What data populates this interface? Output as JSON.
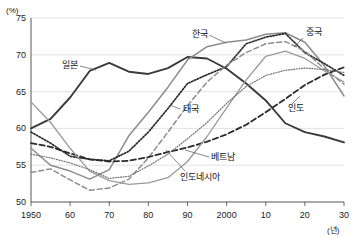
{
  "chart_data": {
    "type": "line",
    "title": "",
    "xlabel": "(년)",
    "ylabel": "(%)",
    "xlim": [
      1950,
      2030
    ],
    "ylim": [
      50,
      75
    ],
    "grid": true,
    "legend": "inline-annotations",
    "y_ticks": [
      "50",
      "55",
      "60",
      "65",
      "70",
      "75"
    ],
    "y_tick_values": [
      50,
      55,
      60,
      65,
      70,
      75
    ],
    "x_ticks": [
      "1950",
      "60",
      "70",
      "80",
      "90",
      "2000",
      "10",
      "20",
      "30"
    ],
    "x_tick_values": [
      1950,
      1960,
      1970,
      1980,
      1990,
      2000,
      2010,
      2020,
      2030
    ],
    "x": [
      1950,
      1955,
      1960,
      1965,
      1970,
      1975,
      1980,
      1985,
      1990,
      1995,
      2000,
      2005,
      2010,
      2015,
      2020,
      2025,
      2030
    ],
    "series": [
      {
        "name": "일본",
        "style": "solid-dark-thick",
        "color": "#3a3a3a",
        "values": [
          60.0,
          61.3,
          64.2,
          67.8,
          68.9,
          67.7,
          67.4,
          68.2,
          69.7,
          69.5,
          68.1,
          66.1,
          63.8,
          60.7,
          59.5,
          58.9,
          58.1
        ]
      },
      {
        "name": "한국",
        "style": "solid-gray",
        "color": "#8c8c8c",
        "values": [
          57.3,
          55.0,
          54.2,
          53.1,
          54.4,
          59.0,
          62.2,
          65.6,
          69.3,
          71.1,
          71.7,
          72.0,
          72.8,
          73.0,
          71.7,
          68.5,
          64.4
        ]
      },
      {
        "name": "중국",
        "style": "dotted-dark",
        "color": "#2b2b2b",
        "values": [
          59.5,
          58.0,
          56.2,
          55.8,
          55.6,
          56.9,
          59.5,
          62.7,
          66.1,
          67.3,
          68.4,
          71.5,
          72.4,
          72.9,
          70.3,
          68.8,
          67.2
        ]
      },
      {
        "name": "태국",
        "style": "dashed-gray",
        "color": "#8c8c8c",
        "values": [
          54.0,
          54.5,
          53.0,
          51.6,
          51.9,
          53.1,
          56.0,
          59.5,
          63.1,
          66.3,
          68.6,
          70.3,
          71.5,
          71.8,
          70.5,
          68.1,
          66.0
        ]
      },
      {
        "name": "인도",
        "style": "dashed-dark",
        "color": "#2b2b2b",
        "values": [
          58.0,
          57.5,
          56.6,
          55.8,
          55.5,
          55.6,
          56.1,
          56.8,
          57.4,
          58.2,
          59.2,
          60.5,
          62.2,
          64.0,
          65.9,
          67.3,
          68.3
        ]
      },
      {
        "name": "베트남",
        "style": "solid-gray-thin",
        "color": "#9a9a9a",
        "values": [
          63.6,
          60.8,
          57.3,
          54.2,
          52.9,
          52.4,
          52.6,
          53.3,
          55.5,
          58.9,
          62.8,
          66.6,
          69.8,
          70.5,
          69.5,
          67.8,
          66.3
        ]
      },
      {
        "name": "인도네시아",
        "style": "dotted-fine",
        "color": "#707070",
        "values": [
          56.5,
          56.0,
          55.3,
          54.4,
          53.2,
          53.5,
          54.9,
          56.5,
          58.6,
          60.8,
          63.4,
          65.7,
          67.2,
          67.9,
          68.2,
          68.0,
          67.6
        ]
      }
    ],
    "annotations": [
      {
        "label": "일본",
        "x": 62,
        "y": 68
      },
      {
        "label": "한국",
        "x": 192,
        "y": 37
      },
      {
        "label": "중국",
        "x": 306,
        "y": 35
      },
      {
        "label": "태국",
        "x": 183,
        "y": 112
      },
      {
        "label": "인도",
        "x": 288,
        "y": 111
      },
      {
        "label": "베트남",
        "x": 211,
        "y": 160
      },
      {
        "label": "인도네시아",
        "x": 180,
        "y": 180
      }
    ]
  }
}
